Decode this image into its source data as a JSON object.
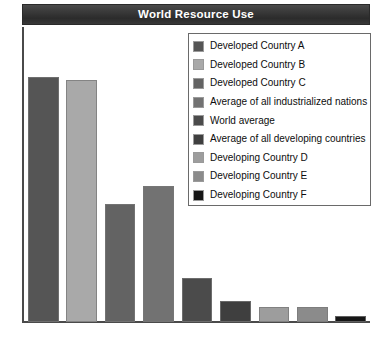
{
  "chart": {
    "title": "World Resource Use",
    "ylabel": "Relative natural resource use"
  },
  "chart_data": {
    "type": "bar",
    "title": "World Resource Use",
    "xlabel": "",
    "ylabel": "Relative natural resource use",
    "ylim": [
      0,
      100
    ],
    "grid": false,
    "legend_position": "top-right",
    "axis_tick_labels": [],
    "categories": [
      "Developed Country A",
      "Developed Country B",
      "Developed Country C",
      "Average of all industrialized nations",
      "World average",
      "Average of all developing countries",
      "Developing Country D",
      "Developing Country E",
      "Developing Country F"
    ],
    "values": [
      83,
      82,
      40,
      46,
      15,
      7,
      5,
      5,
      2
    ],
    "colors": [
      "#555555",
      "#a9a9a9",
      "#636363",
      "#727272",
      "#4b4b4b",
      "#3f3f3f",
      "#9d9d9d",
      "#8b8b8b",
      "#161616"
    ]
  },
  "legend": {
    "items": [
      {
        "label": "Developed Country A",
        "color": "#555555"
      },
      {
        "label": "Developed Country B",
        "color": "#a9a9a9"
      },
      {
        "label": "Developed Country C",
        "color": "#636363"
      },
      {
        "label": "Average of all industrialized nations",
        "color": "#727272"
      },
      {
        "label": "World average",
        "color": "#4b4b4b"
      },
      {
        "label": "Average of all developing countries",
        "color": "#3f3f3f"
      },
      {
        "label": "Developing Country D",
        "color": "#9d9d9d"
      },
      {
        "label": "Developing Country E",
        "color": "#8b8b8b"
      },
      {
        "label": "Developing Country F",
        "color": "#161616"
      }
    ]
  }
}
